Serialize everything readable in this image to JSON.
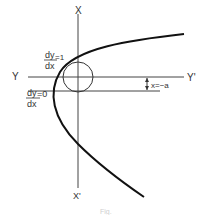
{
  "diagram": {
    "axis_labels": {
      "top": "X",
      "bottom": "X'",
      "left": "Y",
      "right": "Y'"
    },
    "slope_labels": {
      "slope_one": {
        "num": "dy",
        "den": "dx",
        "value": "=1"
      },
      "slope_zero": {
        "num": "dy",
        "den": "dx",
        "value": "=0"
      }
    },
    "offset_label": "x=−a",
    "caption": "Fig."
  }
}
